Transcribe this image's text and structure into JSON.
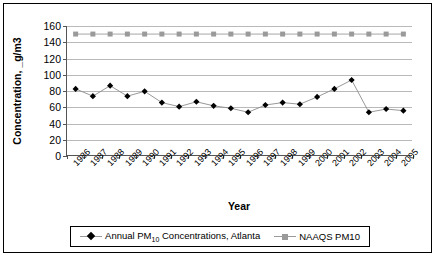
{
  "chart_data": {
    "type": "line",
    "title": "",
    "xlabel": "Year",
    "ylabel": "Concentration, _g/m3",
    "ylim": [
      0,
      160
    ],
    "ytick_step": 20,
    "grid": true,
    "legend_position": "bottom",
    "categories": [
      "1986",
      "1987",
      "1988",
      "1989",
      "1990",
      "1991",
      "1992",
      "1993",
      "1994",
      "1995",
      "1996",
      "1997",
      "1998",
      "1999",
      "2000",
      "2001",
      "2002",
      "2003",
      "2004",
      "2005"
    ],
    "yticks": [
      "0",
      "20",
      "40",
      "60",
      "80",
      "100",
      "120",
      "140",
      "160"
    ],
    "series": [
      {
        "name": "Annual PM10  Concentrations, Atlanta",
        "name_prefix": "Annual PM",
        "name_sub": "10",
        "name_suffix": " Concentrations, Atlanta",
        "marker": "diamond",
        "color": "#000000",
        "line_color": "#8c8c8c",
        "values": [
          82,
          73,
          86,
          73,
          79,
          65,
          60,
          66,
          61,
          58,
          53,
          62,
          65,
          63,
          72,
          82,
          93,
          53,
          57,
          55
        ]
      },
      {
        "name": "NAAQS PM10",
        "marker": "square",
        "color": "#9a9a9a",
        "line_color": "#9a9a9a",
        "values": [
          150,
          150,
          150,
          150,
          150,
          150,
          150,
          150,
          150,
          150,
          150,
          150,
          150,
          150,
          150,
          150,
          150,
          150,
          150,
          150
        ]
      }
    ]
  }
}
